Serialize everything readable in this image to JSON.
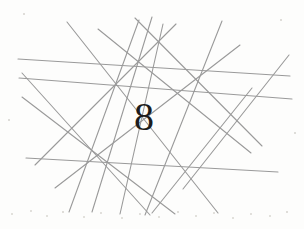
{
  "image": {
    "kind": "captcha-distorted-digit",
    "width": 304,
    "height": 229,
    "background_color": "#fdfdfc",
    "line_color": "#9a9a9a",
    "text_color": "#1d1d1d",
    "noise_color": "#d9d7d2"
  },
  "captcha": {
    "challenge_text": "8",
    "glyphs": [
      {
        "char": "8",
        "x": 134,
        "y": 97,
        "font_size": 40,
        "italic": false,
        "rotation": 0
      }
    ]
  },
  "distortion_lines": [
    {
      "x1": 18,
      "y1": 59,
      "x2": 290,
      "y2": 76,
      "width": 1.1
    },
    {
      "x1": 19,
      "y1": 78,
      "x2": 292,
      "y2": 99,
      "width": 1.1
    },
    {
      "x1": 26,
      "y1": 158,
      "x2": 278,
      "y2": 172,
      "width": 1.1
    },
    {
      "x1": 22,
      "y1": 73,
      "x2": 150,
      "y2": 215,
      "width": 1.1
    },
    {
      "x1": 22,
      "y1": 97,
      "x2": 175,
      "y2": 214,
      "width": 1.1
    },
    {
      "x1": 67,
      "y1": 22,
      "x2": 218,
      "y2": 213,
      "width": 1.1
    },
    {
      "x1": 98,
      "y1": 29,
      "x2": 251,
      "y2": 153,
      "width": 1.1
    },
    {
      "x1": 135,
      "y1": 18,
      "x2": 262,
      "y2": 146,
      "width": 1.1
    },
    {
      "x1": 139,
      "y1": 20,
      "x2": 69,
      "y2": 212,
      "width": 1.1
    },
    {
      "x1": 152,
      "y1": 17,
      "x2": 92,
      "y2": 212,
      "width": 1.1
    },
    {
      "x1": 163,
      "y1": 24,
      "x2": 120,
      "y2": 214,
      "width": 1.1
    },
    {
      "x1": 176,
      "y1": 24,
      "x2": 35,
      "y2": 165,
      "width": 1.1
    },
    {
      "x1": 222,
      "y1": 21,
      "x2": 145,
      "y2": 215,
      "width": 1.1
    },
    {
      "x1": 240,
      "y1": 45,
      "x2": 55,
      "y2": 188,
      "width": 1.1
    },
    {
      "x1": 252,
      "y1": 88,
      "x2": 152,
      "y2": 213,
      "width": 1.1
    },
    {
      "x1": 289,
      "y1": 55,
      "x2": 183,
      "y2": 189,
      "width": 1.1
    }
  ],
  "noise_specks": [
    {
      "x": 12,
      "y": 214,
      "r": 1.1
    },
    {
      "x": 31,
      "y": 211,
      "r": 0.9
    },
    {
      "x": 47,
      "y": 216,
      "r": 1.0
    },
    {
      "x": 63,
      "y": 212,
      "r": 0.8
    },
    {
      "x": 84,
      "y": 217,
      "r": 1.0
    },
    {
      "x": 101,
      "y": 213,
      "r": 0.9
    },
    {
      "x": 122,
      "y": 218,
      "r": 1.1
    },
    {
      "x": 140,
      "y": 214,
      "r": 0.9
    },
    {
      "x": 159,
      "y": 217,
      "r": 1.0
    },
    {
      "x": 178,
      "y": 212,
      "r": 0.8
    },
    {
      "x": 196,
      "y": 216,
      "r": 1.0
    },
    {
      "x": 214,
      "y": 213,
      "r": 0.9
    },
    {
      "x": 233,
      "y": 218,
      "r": 1.1
    },
    {
      "x": 251,
      "y": 214,
      "r": 0.9
    },
    {
      "x": 270,
      "y": 216,
      "r": 1.0
    },
    {
      "x": 287,
      "y": 212,
      "r": 0.8
    },
    {
      "x": 24,
      "y": 14,
      "r": 0.8
    },
    {
      "x": 281,
      "y": 20,
      "r": 0.8
    },
    {
      "x": 9,
      "y": 120,
      "r": 0.7
    },
    {
      "x": 295,
      "y": 133,
      "r": 0.7
    }
  ]
}
